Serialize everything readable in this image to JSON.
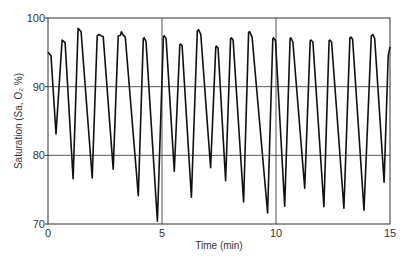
{
  "chart_data": {
    "type": "line",
    "title": "",
    "xlabel": "Time (min)",
    "ylabel": "Saturation (Sa, O₂ %)",
    "xlim": [
      0,
      15
    ],
    "ylim": [
      70,
      100
    ],
    "x_ticks": [
      0,
      5,
      10,
      15
    ],
    "y_ticks": [
      70,
      80,
      90,
      100
    ],
    "grid": {
      "horizontal": [
        80,
        90
      ],
      "vertical": [
        5,
        10
      ]
    },
    "legend": null,
    "series": [
      {
        "name": "SaO2",
        "color": "#111111",
        "x": [
          0.0,
          0.13,
          0.35,
          0.62,
          0.75,
          1.1,
          1.32,
          1.45,
          1.94,
          2.16,
          2.24,
          2.34,
          2.42,
          2.86,
          3.08,
          3.18,
          3.22,
          3.3,
          3.39,
          3.96,
          4.18,
          4.22,
          4.3,
          4.8,
          5.06,
          5.1,
          5.18,
          5.54,
          5.78,
          5.81,
          5.88,
          6.29,
          6.55,
          6.6,
          6.7,
          7.13,
          7.36,
          7.39,
          7.46,
          7.79,
          8.01,
          8.05,
          8.12,
          8.58,
          8.8,
          8.84,
          8.95,
          9.63,
          9.86,
          9.9,
          9.98,
          10.38,
          10.62,
          10.65,
          10.74,
          11.26,
          11.5,
          11.53,
          11.62,
          12.1,
          12.33,
          12.36,
          12.44,
          12.98,
          13.24,
          13.29,
          13.36,
          13.86,
          14.18,
          14.25,
          14.33,
          14.74,
          14.92,
          15.0
        ],
        "y": [
          95.0,
          94.5,
          83.1,
          96.8,
          96.4,
          76.6,
          98.5,
          98.0,
          76.7,
          97.4,
          97.6,
          97.4,
          97.3,
          78.0,
          97.4,
          97.5,
          98.0,
          97.5,
          97.2,
          74.1,
          97.0,
          97.1,
          96.6,
          70.4,
          97.3,
          97.4,
          97.0,
          77.7,
          96.1,
          96.2,
          96.0,
          73.9,
          98.1,
          98.3,
          97.6,
          78.2,
          95.8,
          95.9,
          95.6,
          76.3,
          97.0,
          97.1,
          96.8,
          73.2,
          97.9,
          98.0,
          97.2,
          71.6,
          97.0,
          97.1,
          96.7,
          72.6,
          97.0,
          97.1,
          96.5,
          75.2,
          96.7,
          96.8,
          96.5,
          72.5,
          96.7,
          96.8,
          96.5,
          72.3,
          97.1,
          97.2,
          96.9,
          72.0,
          97.4,
          97.6,
          97.0,
          76.1,
          94.5,
          95.8
        ]
      }
    ]
  }
}
